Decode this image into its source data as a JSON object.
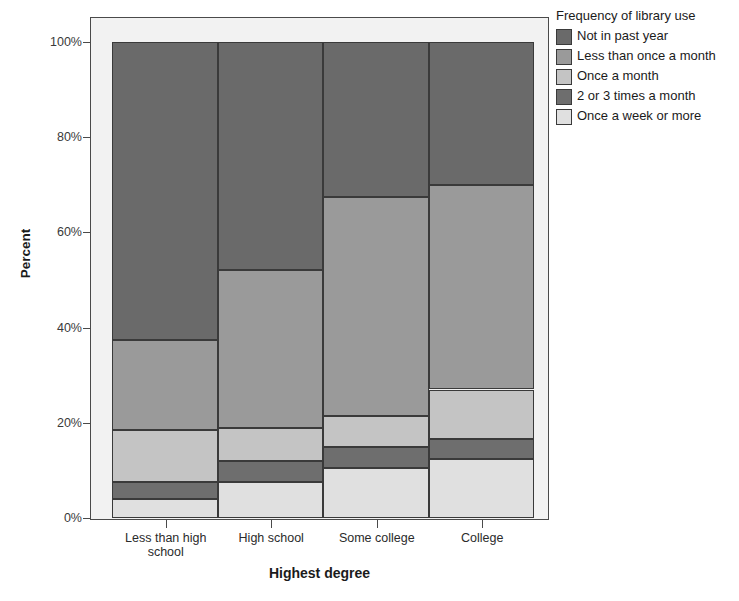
{
  "chart_data": {
    "type": "bar",
    "subtype": "stacked-percent",
    "title": "",
    "xlabel": "Highest degree",
    "ylabel": "Percent",
    "categories": [
      "Less than high school",
      "High school",
      "Some college",
      "College"
    ],
    "category_label_lines": [
      [
        "Less than high",
        "school"
      ],
      [
        "High school"
      ],
      [
        "Some college"
      ],
      [
        "College"
      ]
    ],
    "ylim": [
      0,
      100
    ],
    "ytick_labels": [
      "0%",
      "20%",
      "40%",
      "60%",
      "80%",
      "100%"
    ],
    "ytick_values": [
      0,
      20,
      40,
      60,
      80,
      100
    ],
    "grid": false,
    "legend_position": "right",
    "legend_title": "Frequency of library use",
    "series": [
      {
        "name": "Once a week or more",
        "color": "#e0e0e0",
        "values": [
          4.0,
          7.5,
          10.5,
          12.5
        ]
      },
      {
        "name": "2 or 3 times a month",
        "color": "#6e6e6e",
        "values": [
          3.5,
          4.5,
          4.5,
          4.0
        ]
      },
      {
        "name": "Once a month",
        "color": "#c4c4c4",
        "values": [
          11.0,
          7.0,
          6.5,
          10.5
        ]
      },
      {
        "name": "Less than once a month",
        "color": "#9a9a9a",
        "values": [
          19.0,
          33.0,
          46.0,
          43.0
        ]
      },
      {
        "name": "Not in past year",
        "color": "#6a6a6a",
        "values": [
          62.5,
          48.0,
          32.5,
          30.0
        ]
      }
    ],
    "stack_order_bottom_to_top": [
      "Once a week or more",
      "2 or 3 times a month",
      "Once a month",
      "Less than once a month",
      "Not in past year"
    ]
  },
  "legend": {
    "title": "Frequency of library use",
    "items": [
      {
        "label": "Not in past year",
        "color": "#6a6a6a"
      },
      {
        "label": "Less than once a month",
        "color": "#9a9a9a"
      },
      {
        "label": "Once a month",
        "color": "#c4c4c4"
      },
      {
        "label": "2 or 3 times a month",
        "color": "#6e6e6e"
      },
      {
        "label": "Once a week or more",
        "color": "#e0e0e0"
      }
    ]
  },
  "axes": {
    "y_title": "Percent",
    "x_title": "Highest degree"
  },
  "colors": {
    "plot_background": "#f2f2f2",
    "frame": "#4a4a4a",
    "segment_border": "#3a3a3a",
    "text": "#1b1b1b"
  }
}
